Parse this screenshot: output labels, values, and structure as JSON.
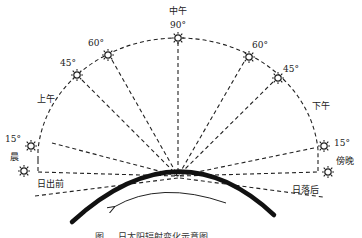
{
  "diagram": {
    "caption_visible": "图 ... 日太阳辐射变化示意图",
    "colors": {
      "line": "#222222",
      "earth": "#111111",
      "background": "#ffffff"
    },
    "labels": {
      "noon": "中午",
      "noon_angle": "90°",
      "left_60": "60°",
      "left_45": "45°",
      "morning": "上午",
      "left_15": "15°",
      "early_morning": "晨",
      "before_sunrise": "日出前",
      "right_60": "60°",
      "right_45": "45°",
      "afternoon": "下午",
      "right_15": "15°",
      "evening": "傍晚",
      "after_sunset": "日落后"
    },
    "sun_positions": [
      {
        "id": "before-sunrise",
        "angle": 0
      },
      {
        "id": "morning-15",
        "angle": 15
      },
      {
        "id": "morning-45",
        "angle": 45
      },
      {
        "id": "morning-60",
        "angle": 60
      },
      {
        "id": "noon-90",
        "angle": 90
      },
      {
        "id": "afternoon-60",
        "angle": 60
      },
      {
        "id": "afternoon-45",
        "angle": 45
      },
      {
        "id": "evening-15",
        "angle": 15
      },
      {
        "id": "after-sunset",
        "angle": 0
      }
    ],
    "rotation_direction": "counter-clockwise (arrow points left)"
  }
}
